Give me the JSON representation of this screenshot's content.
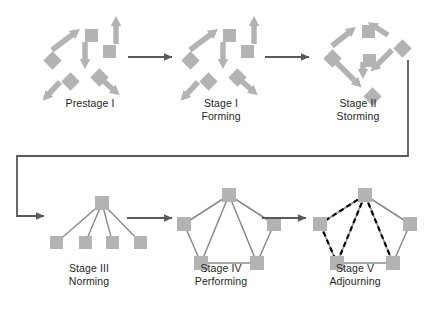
{
  "figure": {
    "background_color": "#ffffff",
    "shape_color": "#b3b3b3",
    "arrow_color": "#58595b",
    "dashed_color": "#000000",
    "label_color": "#231f20"
  },
  "stages": [
    {
      "id": "prestage-1",
      "label_lines": [
        "Prestage I"
      ],
      "label_x": 90,
      "label_y": 97,
      "cluster": "scatter"
    },
    {
      "id": "stage-1-forming",
      "label_lines": [
        "Stage I",
        "Forming"
      ],
      "label_x": 221,
      "label_y": 97,
      "cluster": "scatter"
    },
    {
      "id": "stage-2-storming",
      "label_lines": [
        "Stage II",
        "Storming"
      ],
      "label_x": 358,
      "label_y": 97,
      "cluster": "storming"
    },
    {
      "id": "stage-3-norming",
      "label_lines": [
        "Stage III",
        "Norming"
      ],
      "label_x": 89,
      "label_y": 262,
      "cluster": "hierarchy"
    },
    {
      "id": "stage-4-performing",
      "label_lines": [
        "Stage IV",
        "Performing"
      ],
      "label_x": 221,
      "label_y": 262,
      "cluster": "pentagon"
    },
    {
      "id": "stage-5-adjourning",
      "label_lines": [
        "Stage V",
        "Adjourning"
      ],
      "label_x": 355,
      "label_y": 262,
      "cluster": "pentagon-dashed"
    }
  ],
  "flow_arrows": [
    {
      "id": "arrow-prestage-to-stage1",
      "x1": 128,
      "y1": 57,
      "x2": 172,
      "y2": 57
    },
    {
      "id": "arrow-stage1-to-stage2",
      "x1": 265,
      "y1": 57,
      "x2": 309,
      "y2": 57
    },
    {
      "id": "arrow-stage3-to-stage4",
      "x1": 127,
      "y1": 218,
      "x2": 172,
      "y2": 218
    },
    {
      "id": "arrow-stage4-to-stage5",
      "x1": 262,
      "y1": 218,
      "x2": 306,
      "y2": 218
    }
  ],
  "wrap_connector": {
    "id": "connector-stage2-to-stage3",
    "points": "408,60 408,156 17,156 17,216 44,216"
  },
  "scatter_cluster": {
    "shapes": [
      {
        "type": "diamond",
        "cx": 16,
        "cy": 42,
        "size": 13
      },
      {
        "type": "square",
        "cx": 55,
        "cy": 17,
        "size": 13
      },
      {
        "type": "square",
        "cx": 73,
        "cy": 33,
        "size": 13
      },
      {
        "type": "diamond",
        "cx": 34,
        "cy": 63,
        "size": 13
      },
      {
        "type": "diamond",
        "cx": 63,
        "cy": 59,
        "size": 13
      }
    ],
    "arrows": [
      {
        "id": "scatter-arrow-up-right",
        "x1": 22,
        "y1": 38,
        "x2": 46,
        "y2": 20
      },
      {
        "id": "scatter-arrow-up",
        "x1": 86,
        "y1": 32,
        "x2": 86,
        "y2": 9
      },
      {
        "id": "scatter-arrow-down",
        "x1": 55,
        "y1": 30,
        "x2": 55,
        "y2": 52
      },
      {
        "id": "scatter-arrow-down-left",
        "x1": 30,
        "y1": 70,
        "x2": 16,
        "y2": 85
      },
      {
        "id": "scatter-arrow-down-right",
        "x1": 69,
        "y1": 65,
        "x2": 86,
        "y2": 80
      }
    ]
  },
  "storming_cluster": {
    "shapes": [
      {
        "type": "diamond",
        "cx": 16,
        "cy": 40,
        "size": 13
      },
      {
        "type": "square",
        "cx": 52,
        "cy": 13,
        "size": 13
      },
      {
        "type": "diamond",
        "cx": 86,
        "cy": 30,
        "size": 13
      },
      {
        "type": "square",
        "cx": 53,
        "cy": 42,
        "size": 13
      },
      {
        "type": "diamond",
        "cx": 56,
        "cy": 78,
        "size": 13
      }
    ],
    "arrows": [
      {
        "id": "storming-arrow-upright",
        "x1": 22,
        "y1": 34,
        "x2": 42,
        "y2": 18
      },
      {
        "id": "storming-arrow-upleft",
        "x1": 78,
        "y1": 23,
        "x2": 62,
        "y2": 13
      },
      {
        "id": "storming-arrow-downleft",
        "x1": 82,
        "y1": 38,
        "x2": 64,
        "y2": 56
      },
      {
        "id": "storming-arrow-downcenter",
        "x1": 53,
        "y1": 50,
        "x2": 53,
        "y2": 62
      },
      {
        "id": "storming-arrow-downright",
        "x1": 23,
        "y1": 47,
        "x2": 48,
        "y2": 72
      }
    ]
  },
  "hierarchy_cluster": {
    "top_node": {
      "cx": 53,
      "cy": 6,
      "size": 14
    },
    "bottom_nodes": [
      {
        "cx": 8,
        "cy": 46,
        "size": 13
      },
      {
        "cx": 37,
        "cy": 46,
        "size": 13
      },
      {
        "cx": 64,
        "cy": 46,
        "size": 13
      },
      {
        "cx": 92,
        "cy": 46,
        "size": 13
      }
    ]
  },
  "pentagon_cluster": {
    "nodes": [
      {
        "id": "node-top",
        "cx": 50,
        "cy": 4,
        "size": 14
      },
      {
        "id": "node-left",
        "cx": 5,
        "cy": 33,
        "size": 14
      },
      {
        "id": "node-right",
        "cx": 95,
        "cy": 33,
        "size": 14
      },
      {
        "id": "node-bottom-left",
        "cx": 22,
        "cy": 72,
        "size": 14
      },
      {
        "id": "node-bottom-right",
        "cx": 78,
        "cy": 72,
        "size": 14
      }
    ],
    "solid_edges": [
      [
        "node-top",
        "node-left"
      ],
      [
        "node-top",
        "node-right"
      ],
      [
        "node-top",
        "node-bottom-left"
      ],
      [
        "node-top",
        "node-bottom-right"
      ],
      [
        "node-left",
        "node-bottom-left"
      ],
      [
        "node-right",
        "node-bottom-right"
      ],
      [
        "node-bottom-left",
        "node-bottom-right"
      ]
    ],
    "dashed_edges": [
      [
        "node-top",
        "node-left"
      ],
      [
        "node-left",
        "node-bottom-left"
      ],
      [
        "node-top",
        "node-bottom-left"
      ],
      [
        "node-top",
        "node-bottom-right"
      ]
    ]
  },
  "cluster_origins": {
    "prestage-1": {
      "x": 30,
      "y": 12
    },
    "stage-1-forming": {
      "x": 168,
      "y": 12
    },
    "stage-2-storming": {
      "x": 310,
      "y": 12
    },
    "stage-3-norming": {
      "x": 42,
      "y": 190
    },
    "stage-4-performing": {
      "x": 172,
      "y": 184
    },
    "stage-5-adjourning": {
      "x": 308,
      "y": 184
    }
  }
}
